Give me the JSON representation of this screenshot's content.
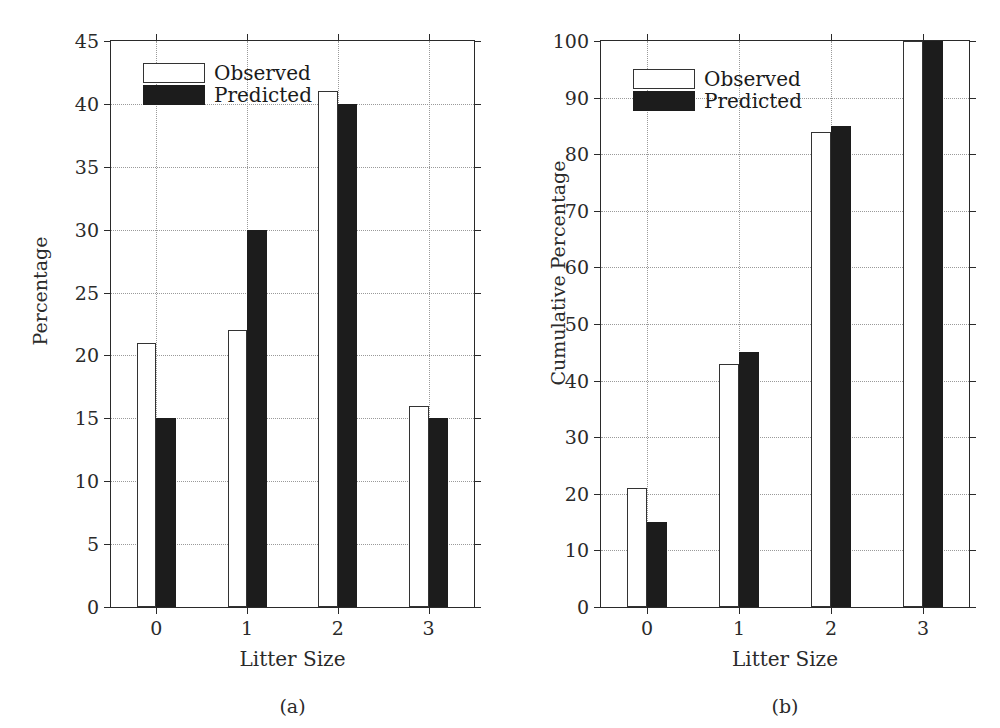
{
  "figure": {
    "panels": [
      {
        "caption": "(a)",
        "legend": [
          {
            "name": "Observed",
            "style": "observed"
          },
          {
            "name": "Predicted",
            "style": "predicted"
          }
        ]
      },
      {
        "caption": "(b)",
        "legend": [
          {
            "name": "Observed",
            "style": "observed"
          },
          {
            "name": "Predicted",
            "style": "predicted"
          }
        ]
      }
    ]
  },
  "chart_data": [
    {
      "type": "bar",
      "panel": "(a)",
      "title": "",
      "xlabel": "Litter Size",
      "ylabel": "Percentage",
      "categories": [
        "0",
        "1",
        "2",
        "3"
      ],
      "series": [
        {
          "name": "Observed",
          "values": [
            21,
            22,
            41,
            16
          ]
        },
        {
          "name": "Predicted",
          "values": [
            15,
            30,
            40,
            15
          ]
        }
      ],
      "ylim": [
        0,
        45
      ],
      "ytick_step": 5,
      "yticks": [
        0,
        5,
        10,
        15,
        20,
        25,
        30,
        35,
        40,
        45
      ],
      "grid": true,
      "legend_position": "upper-left"
    },
    {
      "type": "bar",
      "panel": "(b)",
      "title": "",
      "xlabel": "Litter Size",
      "ylabel": "Cumulative Percentage",
      "categories": [
        "0",
        "1",
        "2",
        "3"
      ],
      "series": [
        {
          "name": "Observed",
          "values": [
            21,
            43,
            84,
            100
          ]
        },
        {
          "name": "Predicted",
          "values": [
            15,
            45,
            85,
            100
          ]
        }
      ],
      "ylim": [
        0,
        100
      ],
      "ytick_step": 10,
      "yticks": [
        0,
        10,
        20,
        30,
        40,
        50,
        60,
        70,
        80,
        90,
        100
      ],
      "grid": true,
      "legend_position": "upper-left"
    }
  ],
  "colors": {
    "observed_fill": "#ffffff",
    "observed_edge": "#333333",
    "predicted_fill": "#1c1c1c",
    "axis": "#2a2a2a",
    "grid": "#9a9a9a",
    "background": "#ffffff"
  }
}
